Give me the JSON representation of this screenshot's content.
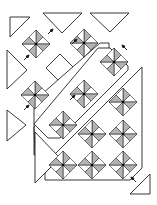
{
  "diagram": {
    "colors": {
      "outline": "#222222",
      "shaded_triangle": "#b3b3b3",
      "background": "#ffffff"
    },
    "block_types": [
      {
        "name": "pinwheel-star-block",
        "description": "Square on point divided into 8 triangles, alternating shaded and white"
      },
      {
        "name": "plain-square-block",
        "description": "Plain white square on point"
      },
      {
        "name": "setting-triangle",
        "description": "Side setting triangle"
      },
      {
        "name": "corner-triangle",
        "description": "Corner triangle"
      },
      {
        "name": "assembled-section",
        "description": "Joined diagonal strip of blocks"
      }
    ],
    "counts": {
      "star_blocks": 12,
      "plain_squares": 2,
      "setting_triangles": 6,
      "corner_triangles": 2,
      "arrows": 7
    }
  }
}
